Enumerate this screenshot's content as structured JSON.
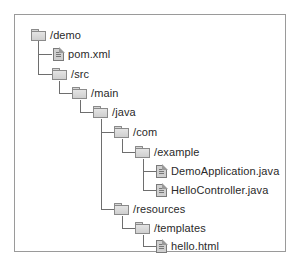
{
  "diagram": {
    "type": "file-tree",
    "nodes": [
      {
        "id": "demo",
        "label": "/demo",
        "kind": "folder",
        "depth": 0
      },
      {
        "id": "pom",
        "label": "pom.xml",
        "kind": "file",
        "depth": 1
      },
      {
        "id": "src",
        "label": "/src",
        "kind": "folder",
        "depth": 1
      },
      {
        "id": "main",
        "label": "/main",
        "kind": "folder",
        "depth": 2
      },
      {
        "id": "java",
        "label": "/java",
        "kind": "folder",
        "depth": 3
      },
      {
        "id": "com",
        "label": "/com",
        "kind": "folder",
        "depth": 4
      },
      {
        "id": "example",
        "label": "/example",
        "kind": "folder",
        "depth": 5
      },
      {
        "id": "demoapp",
        "label": "DemoApplication.java",
        "kind": "file",
        "depth": 6
      },
      {
        "id": "helloctrl",
        "label": "HelloController.java",
        "kind": "file",
        "depth": 6
      },
      {
        "id": "resources",
        "label": "/resources",
        "kind": "folder",
        "depth": 4
      },
      {
        "id": "templates",
        "label": "/templates",
        "kind": "folder",
        "depth": 5
      },
      {
        "id": "hello",
        "label": "hello.html",
        "kind": "file",
        "depth": 6
      }
    ],
    "icons": {
      "folder": "folder-icon",
      "file": "file-icon"
    },
    "colors": {
      "border": "#9a9a9a",
      "connector": "#6e6e6e",
      "icon_fill": "#d6d6d6",
      "text": "#2a2a2a"
    }
  },
  "caption": {
    "text": "",
    "note": "clipped"
  }
}
